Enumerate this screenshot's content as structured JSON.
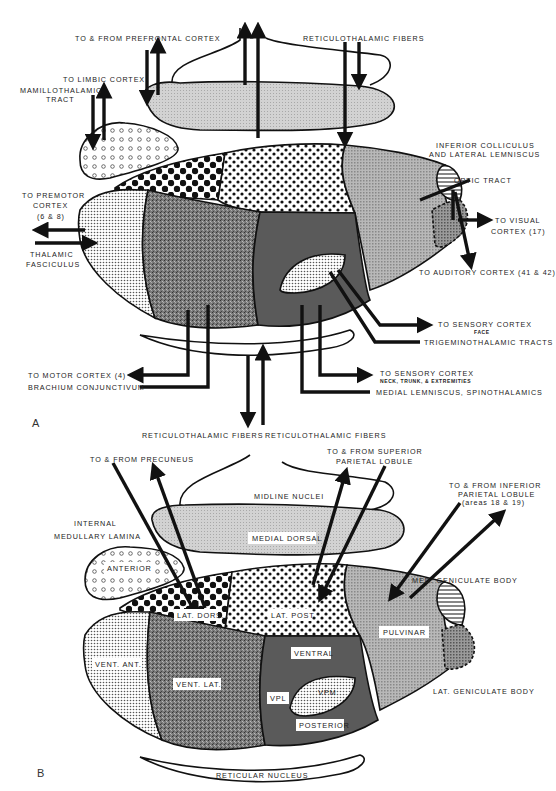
{
  "figure": {
    "panels": [
      {
        "id": "A",
        "label": "A",
        "labels": {
          "prefrontal": "TO & FROM PREFRONTAL CORTEX",
          "reticulothalamic": "RETICULOTHALAMIC FIBERS",
          "limbic": "TO LIMBIC CORTEX",
          "mamillothalamic_1": "MAMILLOTHALAMIC",
          "mamillothalamic_2": "TRACT",
          "inferior_colliculus_1": "INFERIOR COLLICULUS",
          "inferior_colliculus_2": "AND LATERAL LEMNISCUS",
          "optic_tract": "OPTIC TRACT",
          "visual_1": "TO VISUAL",
          "visual_2": "CORTEX (17)",
          "premotor_1": "TO PREMOTOR",
          "premotor_2": "CORTEX",
          "premotor_3": "(6 & 8)",
          "thalamic_fasciculus_1": "THALAMIC",
          "thalamic_fasciculus_2": "FASCICULUS",
          "auditory": "TO AUDITORY CORTEX (41 & 42)",
          "sensory_face_1": "TO SENSORY CORTEX",
          "sensory_face_2": "FACE",
          "trigeminothalamic": "TRIGEMINOTHALAMIC TRACTS",
          "motor": "TO MOTOR CORTEX (4)",
          "brachium": "BRACHIUM CONJUNCTIVUM",
          "sensory_neck_1": "TO SENSORY CORTEX",
          "sensory_neck_2": "NECK, TRUNK, & EXTREMITIES",
          "medial_lemniscus": "MEDIAL LEMNISCUS, SPINOTHALAMICS"
        }
      },
      {
        "id": "B",
        "label": "B",
        "labels": {
          "reticulothalamic_left": "RETICULOTHALAMIC FIBERS",
          "reticulothalamic_right": "RETICULOTHALAMIC FIBERS",
          "precuneus": "TO & FROM PRECUNEUS",
          "superior_parietal_1": "TO & FROM SUPERIOR",
          "superior_parietal_2": "PARIETAL LOBULE",
          "inferior_parietal_1": "TO & FROM INFERIOR",
          "inferior_parietal_2": "PARIETAL LOBULE",
          "inferior_parietal_3": "(areas 18 & 19)",
          "midline_nuclei": "MIDLINE NUCLEI",
          "internal_lamina_1": "INTERNAL",
          "internal_lamina_2": "MEDULLARY LAMINA",
          "medial_dorsal": "MEDIAL DORSAL",
          "anterior": "ANTERIOR",
          "lat_dors": "LAT. DORS.",
          "lat_post": "LAT. POST.",
          "med_geniculate": "MED. GENICULATE BODY",
          "pulvinar": "PULVINAR",
          "vent_ant": "VENT. ANT.",
          "vent_lat": "VENT. LAT.",
          "ventral": "VENTRAL",
          "vpl": "VPL",
          "vpm": "VPM",
          "posterior": "POSTERIOR",
          "lat_geniculate": "LAT. GENICULATE BODY",
          "reticular_nucleus": "RETICULAR NUCLEUS"
        }
      }
    ],
    "colors": {
      "background": "#ffffff",
      "ink": "#111111",
      "medial_dorsal_fill": "#c8c8c8",
      "vent_lat_fill": "#7a7a7a",
      "ventral_posterior_fill": "#585858",
      "pulvinar_fill": "#b4b4b4",
      "vpm_fill": "#e8e8e8"
    }
  }
}
